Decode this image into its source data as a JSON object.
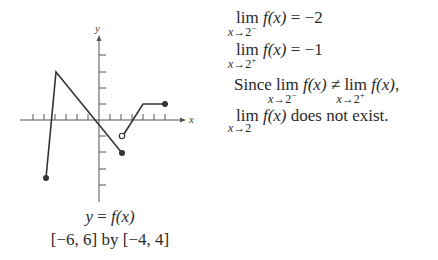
{
  "graph": {
    "y_axis_label": "y",
    "x_axis_label": "x",
    "window": {
      "xmin": -6,
      "xmax": 6,
      "ymin": -4,
      "ymax": 4
    },
    "points": [
      {
        "x": -5,
        "y": -3.5,
        "type": "closed"
      },
      {
        "x": -4,
        "y": 3,
        "type": "vertex"
      },
      {
        "x": 2,
        "y": -2,
        "type": "closed"
      },
      {
        "x": 2,
        "y": -1,
        "type": "open"
      },
      {
        "x": 4,
        "y": 1,
        "type": "vertex"
      },
      {
        "x": 6,
        "y": 1,
        "type": "closed"
      }
    ]
  },
  "caption": {
    "equation_lhs": "y",
    "equation_eq": " = ",
    "equation_rhs": "f(x)",
    "window_text": "[−6, 6] by [−4, 4]"
  },
  "statements": {
    "line1": {
      "lim": "lim",
      "sub_var": "x",
      "sub_arrow": "→2",
      "sub_side": "−",
      "expr": "f(x)",
      "rel": " = −2"
    },
    "line2": {
      "lim": "lim",
      "sub_var": "x",
      "sub_arrow": "→2",
      "sub_side": "+",
      "expr": "f(x)",
      "rel": " = −1"
    },
    "line3": {
      "lead": "Since ",
      "lim_a": "lim",
      "sub_a_var": "x",
      "sub_a_arrow": "→2",
      "sub_a_side": "−",
      "expr_a": "f(x)",
      "neq": " ≠ ",
      "lim_b": "lim",
      "sub_b_var": "x",
      "sub_b_arrow": "→2",
      "sub_b_side": "+",
      "expr_b": "f(x)",
      "tail": ","
    },
    "line4": {
      "lim": "lim",
      "sub_var": "x",
      "sub_arrow": "→2",
      "expr": "f(x)",
      "tail": " does not exist."
    }
  }
}
